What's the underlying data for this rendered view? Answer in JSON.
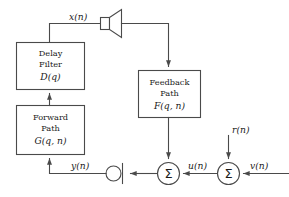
{
  "diagram": {
    "stroke_color": "#4a4a4a",
    "text_color": "#1a1a1a",
    "background": "#ffffff",
    "blocks": [
      {
        "id": "delay-filter",
        "line1": "Delay",
        "line2": "Filter",
        "math": "D(q)"
      },
      {
        "id": "forward-path",
        "line1": "Forward",
        "line2": "Path",
        "math": "G(q, n)"
      },
      {
        "id": "feedback-path",
        "line1": "Feedback",
        "line2": "Path",
        "math": "F(q, n)"
      }
    ],
    "signals": {
      "x": "x(n)",
      "y": "y(n)",
      "u": "u(n)",
      "r": "r(n)",
      "v": "v(n)"
    },
    "nodes": {
      "sum_left": "Σ",
      "sum_right": "Σ",
      "loudspeaker": "loudspeaker-icon",
      "microphone": "microphone-icon"
    }
  }
}
